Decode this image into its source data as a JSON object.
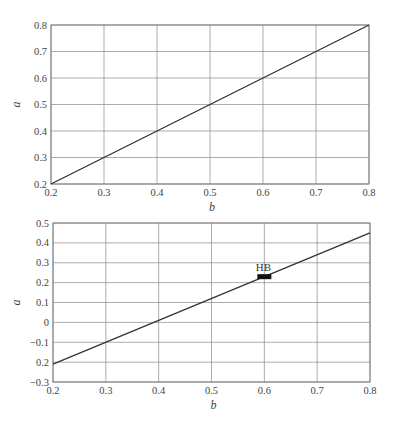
{
  "chart_data": [
    {
      "type": "line",
      "title": "",
      "xlabel": "b",
      "ylabel": "a",
      "xlim": [
        0.2,
        0.8
      ],
      "ylim": [
        0.2,
        0.8
      ],
      "grid": true,
      "xticks": [
        "0.2",
        "0.3",
        "0.4",
        "0.5",
        "0.6",
        "0.7",
        "0.8"
      ],
      "yticks": [
        "0.2",
        "0.3",
        "0.4",
        "0.5",
        "0.6",
        "0.7",
        "0.8"
      ],
      "series": [
        {
          "name": "line",
          "x": [
            0.2,
            0.8
          ],
          "y": [
            0.2,
            0.8
          ]
        }
      ]
    },
    {
      "type": "line",
      "title": "",
      "xlabel": "b",
      "ylabel": "a",
      "xlim": [
        0.2,
        0.8
      ],
      "ylim": [
        -0.3,
        0.5
      ],
      "grid": true,
      "xticks": [
        "0.2",
        "0.3",
        "0.4",
        "0.5",
        "0.6",
        "0.7",
        "0.8"
      ],
      "yticks": [
        "−0.3",
        "0.2",
        "−0.1",
        "0",
        "0.1",
        "0.2",
        "0.3",
        "0.4",
        "0.5"
      ],
      "series": [
        {
          "name": "line",
          "x": [
            0.2,
            0.8
          ],
          "y": [
            -0.21,
            0.45
          ]
        }
      ],
      "annotations": [
        {
          "label": "HB",
          "x": 0.6,
          "y": 0.23,
          "marker": "filled-rectangle"
        }
      ]
    }
  ]
}
